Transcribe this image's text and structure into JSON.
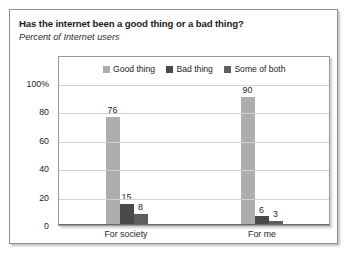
{
  "title": "Has the internet been a good thing or a bad thing?",
  "subtitle": "Percent of Internet users",
  "colors": {
    "good_thing": "#ADADAD",
    "bad_thing": "#4A4A4A",
    "some_of_both": "#5E5E5E",
    "gridline": "#D2D2D2",
    "axis": "#6A6A6A",
    "text": "#1D1D1D"
  },
  "chart_data": {
    "type": "bar",
    "title": "Has the internet been a good thing or a bad thing?",
    "subtitle": "Percent of Internet users",
    "xlabel": "",
    "ylabel": "",
    "ylim": [
      0,
      100
    ],
    "yticks": [
      0,
      20,
      40,
      60,
      80,
      100
    ],
    "ytick_labels": [
      "0",
      "20",
      "40",
      "60",
      "80",
      "100%"
    ],
    "grid": true,
    "legend_position": "top-center",
    "categories": [
      "For society",
      "For me"
    ],
    "series": [
      {
        "name": "Good thing",
        "color": "#ADADAD",
        "values": [
          76,
          90
        ]
      },
      {
        "name": "Bad thing",
        "color": "#4A4A4A",
        "values": [
          15,
          6
        ]
      },
      {
        "name": "Some of both",
        "color": "#5E5E5E",
        "values": [
          8,
          3
        ]
      }
    ],
    "data_labels": {
      "For society": {
        "Good thing": "76",
        "Bad thing": "15",
        "Some of both": "8"
      },
      "For me": {
        "Good thing": "90",
        "Bad thing": "6",
        "Some of both": "3"
      }
    }
  }
}
